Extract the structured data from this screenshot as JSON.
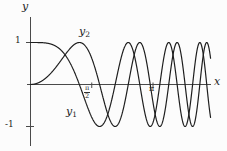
{
  "figure": {
    "background_color": "#fcfcfc",
    "curve_color": "#1e1e1e",
    "axis_color": "#4a4a4a"
  },
  "chart_data": {
    "type": "line",
    "title": "",
    "xlabel": "x",
    "ylabel": "y",
    "x_range": [
      0,
      4.62
    ],
    "y_range": [
      -1.15,
      1.15
    ],
    "grid": false,
    "legend_position": "inline-curve-labels",
    "x_ticks": [
      {
        "value": 1.5707963,
        "label": "π/2",
        "numerator": "π",
        "denominator": "2"
      },
      {
        "value": 3.1415927,
        "label": "π"
      }
    ],
    "y_ticks": [
      {
        "value": 1,
        "label": "1"
      },
      {
        "value": -1,
        "label": "-1"
      }
    ],
    "series": [
      {
        "name": "y1",
        "label_base": "y",
        "label_sub": "1",
        "formula": "cos(x^2)",
        "start_point": [
          0,
          1
        ],
        "amplitude": 1,
        "color": "#1e1e1e"
      },
      {
        "name": "y2",
        "label_base": "y",
        "label_sub": "2",
        "formula": "sin(x^2)",
        "start_point": [
          0,
          0
        ],
        "amplitude": 1,
        "color": "#1e1e1e"
      }
    ]
  }
}
